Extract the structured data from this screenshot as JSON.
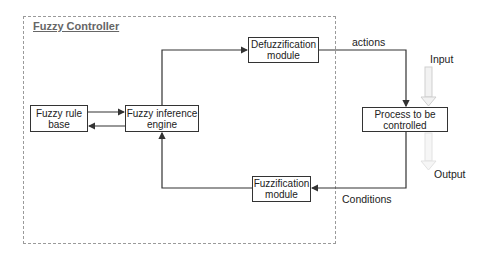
{
  "diagram": {
    "container_title": "Fuzzy Controller",
    "nodes": [
      {
        "id": "rule-base",
        "label": "Fuzzy rule base"
      },
      {
        "id": "inference",
        "label": "Fuzzy inference engine"
      },
      {
        "id": "defuzz",
        "label": "Defuzzification module"
      },
      {
        "id": "fuzz",
        "label": "Fuzzification module"
      },
      {
        "id": "process",
        "label": "Process to be controlled"
      }
    ],
    "edges": [
      {
        "from": "rule-base",
        "to": "inference"
      },
      {
        "from": "inference",
        "to": "rule-base"
      },
      {
        "from": "inference",
        "to": "defuzz"
      },
      {
        "from": "defuzz",
        "to": "process",
        "label": "actions"
      },
      {
        "from": "process",
        "to": "fuzz",
        "label": "Conditions"
      },
      {
        "from": "fuzz",
        "to": "inference"
      }
    ],
    "labels": {
      "actions": "actions",
      "conditions": "Conditions",
      "input": "Input",
      "output": "Output"
    },
    "colors": {
      "line": "#333333",
      "frame": "#9a9a9a",
      "io_arrow": "#d0d0d0",
      "title": "#666666"
    }
  }
}
